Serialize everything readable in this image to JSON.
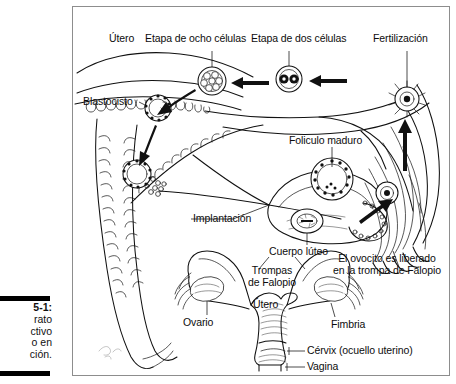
{
  "figure": {
    "caption": {
      "number": "5-1:",
      "lines": [
        "rato",
        "ctivo",
        "o en",
        "ción."
      ],
      "note": "caption text clipped at left page edge"
    },
    "title_alt": "Aparato reproductivo femenino en acción",
    "border_color": "#8d8d8d",
    "ink_color": "#111111",
    "background": "#ffffff"
  },
  "labels": {
    "utero_top": "Útero",
    "etapa_ocho": "Etapa de ocho células",
    "etapa_dos": "Etapa de dos células",
    "fertilizacion": "Fertilización",
    "blastocisto": "Blastocisto",
    "foliculo_maduro": "Foliculo maduro",
    "implantacion": "Implantación",
    "cuerpo_luteo": "Cuerpo lúteo",
    "ovocito_liberado_l1": "El ovocito es liberado",
    "ovocito_liberado_l2": "en la trompa de Falopio",
    "trompas_l1": "Trompas",
    "trompas_l2": "de Falopio",
    "utero_bottom": "Útero",
    "ovario": "Ovario",
    "fimbria": "Fimbria",
    "cervix": "Cérvix (ocuello uterino)",
    "vagina": "Vagina"
  },
  "diagram": {
    "type": "anatomical-illustration",
    "sequence": [
      "Fertilización",
      "Etapa de dos células",
      "Etapa de ocho células",
      "Blastocisto",
      "Implantación"
    ],
    "structures": [
      "Útero",
      "Trompas de Falopio",
      "Fimbria",
      "Ovario",
      "Folículo maduro",
      "Cuerpo lúteo",
      "Cérvix",
      "Vagina"
    ],
    "arrow_direction": "right-to-left along the fallopian tube toward the uterus"
  }
}
